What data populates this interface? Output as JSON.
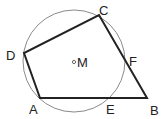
{
  "diagram": {
    "type": "geometry",
    "circle": {
      "center_label": "M",
      "cx": 74,
      "cy": 61,
      "r": 51,
      "stroke": "#888888"
    },
    "points": {
      "A": {
        "label": "A",
        "x": 40,
        "y": 98
      },
      "B": {
        "label": "B",
        "x": 147,
        "y": 98
      },
      "C": {
        "label": "C",
        "x": 99,
        "y": 15
      },
      "D": {
        "label": "D",
        "x": 24,
        "y": 53
      },
      "E": {
        "label": "E",
        "x": 110,
        "y": 98
      },
      "F": {
        "label": "F",
        "x": 125,
        "y": 58
      },
      "M": {
        "label": "M",
        "x": 74,
        "y": 62
      }
    },
    "polygon": [
      "A",
      "B",
      "C",
      "D"
    ],
    "line_color": "#222222"
  }
}
